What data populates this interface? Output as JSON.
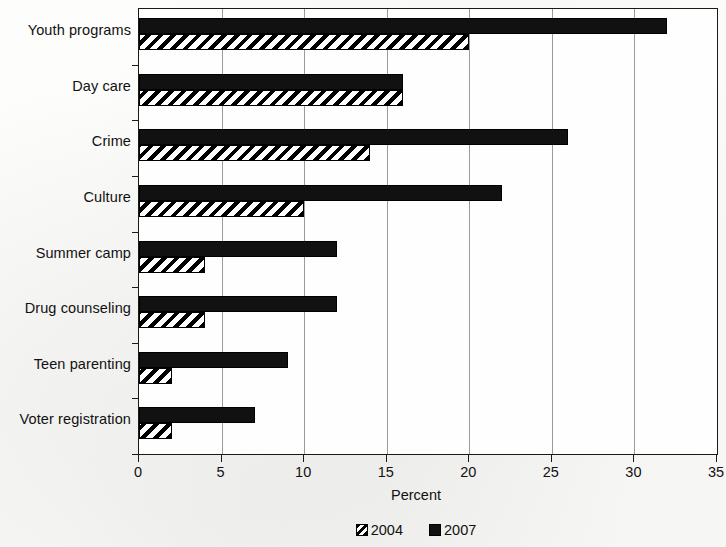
{
  "chart_data": {
    "type": "bar",
    "orientation": "horizontal",
    "title": "",
    "xlabel": "Percent",
    "ylabel": "",
    "xlim": [
      0,
      35
    ],
    "xticks": [
      0,
      5,
      10,
      15,
      20,
      25,
      30,
      35
    ],
    "grid": true,
    "grid_axis": "x",
    "legend_position": "bottom-center",
    "categories": [
      "Youth programs",
      "Day care",
      "Crime",
      "Culture",
      "Summer camp",
      "Drug counseling",
      "Teen parenting",
      "Voter registration"
    ],
    "series": [
      {
        "name": "2007",
        "style": "solid-black",
        "color": "#111111",
        "values": [
          32,
          16,
          26,
          22,
          12,
          12,
          9,
          7
        ]
      },
      {
        "name": "2004",
        "style": "diagonal-hatch",
        "color": "#000000",
        "values": [
          20,
          16,
          14,
          10,
          4,
          4,
          2,
          2
        ]
      }
    ]
  },
  "legend": {
    "items": [
      {
        "label": "2004",
        "swatch": "hatch-swatch-icon"
      },
      {
        "label": "2007",
        "swatch": "solid-swatch-icon"
      }
    ]
  }
}
